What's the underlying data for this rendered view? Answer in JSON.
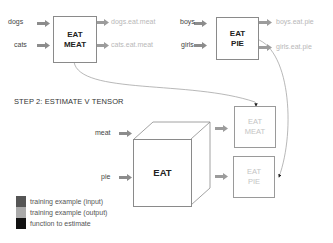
{
  "step1": {
    "left_group": {
      "inputs": [
        "dogs",
        "cats"
      ],
      "function_label": [
        "EAT",
        "MEAT"
      ],
      "outputs": [
        "dogs.eat.meat",
        "cats.eat.meat"
      ]
    },
    "right_group": {
      "inputs": [
        "boys",
        "girls"
      ],
      "function_label": [
        "EAT",
        "PIE"
      ],
      "outputs": [
        "boys.eat.pie",
        "girls.eat.pie"
      ]
    }
  },
  "step2": {
    "title": "STEP 2: ESTIMATE V TENSOR",
    "inputs": [
      "meat",
      "pie"
    ],
    "tensor_label": "EAT",
    "outputs": [
      [
        "EAT",
        "MEAT"
      ],
      [
        "EAT",
        "PIE"
      ]
    ]
  },
  "legend": [
    {
      "label": "training example (input)",
      "color": "#555555"
    },
    {
      "label": "training example (output)",
      "color": "#aaaaaa"
    },
    {
      "label": "function to estimate",
      "color": "#111111"
    }
  ],
  "colors": {
    "input_arrow": "#888888",
    "output_arrow": "#9a9a9a",
    "box_border": "#8a8a8a",
    "connector": "#999999"
  }
}
